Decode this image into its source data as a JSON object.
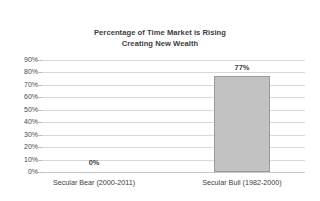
{
  "chart_data": {
    "type": "bar",
    "title": "Percentage of Time Market is Rising Creating New Wealth",
    "title_lines": [
      "Percentage of Time Market is Rising",
      "Creating New Wealth"
    ],
    "categories": [
      "Secular Bear (2000-2011)",
      "Secular Bull (1982-2000)"
    ],
    "values": [
      0,
      77
    ],
    "value_labels": [
      "0%",
      "77%"
    ],
    "xlabel": "",
    "ylabel": "",
    "ylim": [
      0,
      90
    ],
    "ytick_labels": [
      "90%",
      "80%",
      "70%",
      "60%",
      "50%",
      "40%",
      "30%",
      "20%",
      "10%",
      "0%"
    ],
    "ytick_values": [
      90,
      80,
      70,
      60,
      50,
      40,
      30,
      20,
      10,
      0
    ],
    "grid": true,
    "legend": "none",
    "colors": {
      "bar_fill": "#c2c2c2",
      "bar_border": "#9a9a9a",
      "gridline": "#d9d9d9",
      "text": "#3d3d3d",
      "title": "#404040",
      "background": "#ffffff"
    }
  }
}
